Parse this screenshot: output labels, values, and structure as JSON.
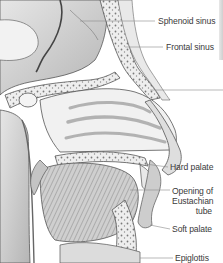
{
  "figure": {
    "labels": [
      {
        "id": "sphenoid-sinus",
        "text": "Sphenoid sinus"
      },
      {
        "id": "frontal-sinus",
        "text": "Frontal sinus"
      },
      {
        "id": "hard-palate",
        "text": "Hard palate"
      },
      {
        "id": "eustachian-line1",
        "text": "Opening of"
      },
      {
        "id": "eustachian-line2",
        "text": "Eustachian"
      },
      {
        "id": "eustachian-line3",
        "text": "tube"
      },
      {
        "id": "soft-palate",
        "text": "Soft palate"
      },
      {
        "id": "epiglottis",
        "text": "Epiglottis"
      }
    ],
    "colors": {
      "background": "#ffffff",
      "ink": "#3a3a3a",
      "shade_dark": "#6e6e6e",
      "shade_mid": "#a8a8a8",
      "shade_light": "#d9d9d9",
      "leader_line": "#8a8a8a"
    }
  }
}
